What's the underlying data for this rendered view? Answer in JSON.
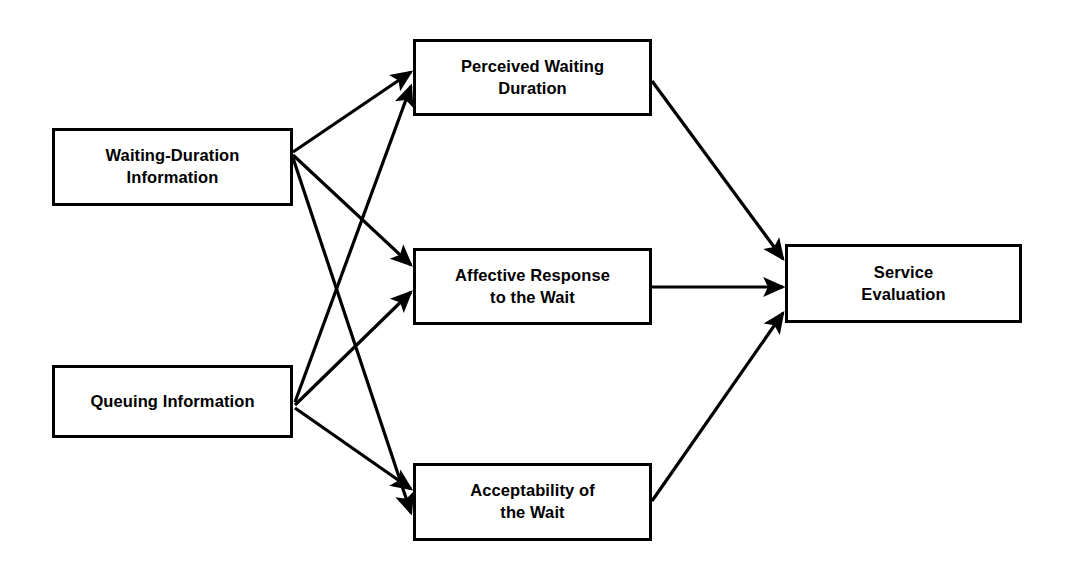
{
  "diagram": {
    "type": "conceptual-model-flow-diagram",
    "background_color": "#ffffff",
    "line_color": "#000000",
    "nodes": [
      {
        "id": "waiting-duration-information",
        "label": "Waiting-Duration\nInformation",
        "column": "antecedent",
        "x": 52,
        "y": 128,
        "width": 241,
        "height": 78
      },
      {
        "id": "queuing-information",
        "label": "Queuing Information",
        "column": "antecedent",
        "x": 52,
        "y": 365,
        "width": 241,
        "height": 73
      },
      {
        "id": "perceived-waiting-duration",
        "label": "Perceived Waiting\nDuration",
        "column": "mediator",
        "x": 413,
        "y": 39,
        "width": 239,
        "height": 77
      },
      {
        "id": "affective-response-to-the-wait",
        "label": "Affective Response\nto the Wait",
        "column": "mediator",
        "x": 413,
        "y": 248,
        "width": 239,
        "height": 77
      },
      {
        "id": "acceptability-of-the-wait",
        "label": "Acceptability of\nthe Wait",
        "column": "mediator",
        "x": 413,
        "y": 463,
        "width": 239,
        "height": 78
      },
      {
        "id": "service-evaluation",
        "label": "Service\nEvaluation",
        "column": "outcome",
        "x": 785,
        "y": 244,
        "width": 237,
        "height": 79
      }
    ],
    "edges": [
      {
        "id": "edge-wdi-to-pwd",
        "from": "waiting-duration-information",
        "to": "perceived-waiting-duration",
        "x1": 293,
        "y1": 152,
        "x2": 411,
        "y2": 72
      },
      {
        "id": "edge-wdi-to-arw",
        "from": "waiting-duration-information",
        "to": "affective-response-to-the-wait",
        "x1": 293,
        "y1": 155,
        "x2": 411,
        "y2": 265
      },
      {
        "id": "edge-wdi-to-aw",
        "from": "waiting-duration-information",
        "to": "acceptability-of-the-wait",
        "x1": 293,
        "y1": 158,
        "x2": 411,
        "y2": 513
      },
      {
        "id": "edge-qi-to-pwd",
        "from": "queuing-information",
        "to": "perceived-waiting-duration",
        "x1": 295,
        "y1": 402,
        "x2": 411,
        "y2": 86
      },
      {
        "id": "edge-qi-to-arw",
        "from": "queuing-information",
        "to": "affective-response-to-the-wait",
        "x1": 295,
        "y1": 405,
        "x2": 411,
        "y2": 292
      },
      {
        "id": "edge-qi-to-aw",
        "from": "queuing-information",
        "to": "acceptability-of-the-wait",
        "x1": 295,
        "y1": 408,
        "x2": 411,
        "y2": 489
      },
      {
        "id": "edge-pwd-to-se",
        "from": "perceived-waiting-duration",
        "to": "service-evaluation",
        "x1": 652,
        "y1": 81,
        "x2": 783,
        "y2": 259
      },
      {
        "id": "edge-arw-to-se",
        "from": "affective-response-to-the-wait",
        "to": "service-evaluation",
        "x1": 652,
        "y1": 287,
        "x2": 783,
        "y2": 287
      },
      {
        "id": "edge-aw-to-se",
        "from": "acceptability-of-the-wait",
        "to": "service-evaluation",
        "x1": 652,
        "y1": 501,
        "x2": 783,
        "y2": 313
      }
    ]
  }
}
